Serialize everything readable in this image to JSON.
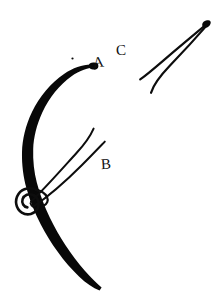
{
  "figure": {
    "background_color": "#ffffff",
    "ink_color": "#0d0d0d",
    "width": 223,
    "height": 307,
    "labels": [
      {
        "id": "A",
        "text": "A",
        "x": 93,
        "y": 55,
        "refers_to": "curved-needle-tip"
      },
      {
        "id": "B",
        "text": "B",
        "x": 101,
        "y": 157,
        "refers_to": "straight-needle-holder"
      },
      {
        "id": "C",
        "text": "C",
        "x": 116,
        "y": 43,
        "refers_to": "detached-needle"
      }
    ],
    "elements": [
      {
        "name": "curved-needle-body",
        "description": "Thick tapering ink arc curving from upper right down and around to lower right",
        "stroke_style": "solid-filled"
      },
      {
        "name": "thread-loop-knot",
        "description": "Small spiral loop of thread wrapped at the lower left of the arc",
        "stroke_style": "thin-outline"
      },
      {
        "name": "straight-needle-holder",
        "description": "Pair of thin converging lines running from lower left up to upper right",
        "stroke_style": "thin-line"
      },
      {
        "name": "detached-needle",
        "description": "Narrow V-shaped pair of thin lines meeting at a point at the upper right",
        "stroke_style": "thin-line"
      },
      {
        "name": "ink-speck",
        "description": "Small stray ink dot above the arc",
        "stroke_style": "dot"
      }
    ]
  }
}
